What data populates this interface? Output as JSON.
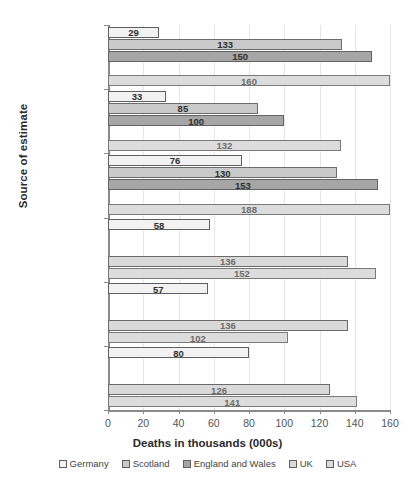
{
  "chart_data": {
    "type": "bar",
    "orientation": "horizontal",
    "title": "",
    "xlabel": "Deaths in thousands (000s)",
    "ylabel": "Source of estimate",
    "xlim": [
      0,
      160
    ],
    "xticks": [
      0,
      20,
      40,
      60,
      80,
      100,
      120,
      140,
      160
    ],
    "grid": true,
    "legend_position": "bottom",
    "note": "Kontis et al* USA bar (188) extends beyond the 160 axis maximum and is clipped at the plot edge.",
    "categories": [
      "Islam et al",
      "Parildar et al",
      "Kontis et al*",
      "Economist",
      "Mathieu et al",
      "WHO"
    ],
    "series": [
      {
        "name": "Germany",
        "color": "#f2f2f2",
        "values": [
          29,
          33,
          76,
          58,
          57,
          80
        ]
      },
      {
        "name": "Scotland",
        "color": "#c9c9c9",
        "values": [
          133,
          85,
          130,
          null,
          null,
          null
        ]
      },
      {
        "name": "England and Wales",
        "color": "#a6a6a6",
        "values": [
          150,
          100,
          153,
          null,
          null,
          null
        ]
      },
      {
        "name": "UK",
        "color": "#d9d9d9",
        "values": [
          null,
          null,
          null,
          136,
          136,
          126
        ]
      },
      {
        "name": "USA",
        "color": "#dcdcdc",
        "values": [
          160,
          132,
          188,
          152,
          102,
          141
        ]
      }
    ]
  },
  "legend": {
    "items": [
      {
        "label": "Germany"
      },
      {
        "label": "Scotland"
      },
      {
        "label": "England and Wales"
      },
      {
        "label": "UK"
      },
      {
        "label": "USA"
      }
    ]
  }
}
